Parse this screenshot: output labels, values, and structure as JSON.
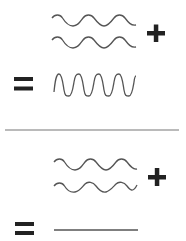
{
  "diagram": {
    "colors": {
      "wave": "#555555",
      "symbol": "#222222",
      "divider": "#777777",
      "background": "#ffffff"
    },
    "panels": [
      {
        "name": "constructive-interference",
        "inputs": [
          {
            "label": "wave-a",
            "cycles": 4,
            "amplitude": 5,
            "phase": "in-phase"
          },
          {
            "label": "wave-b",
            "cycles": 4,
            "amplitude": 5,
            "phase": "in-phase"
          }
        ],
        "operator": "+",
        "equals": "=",
        "result": {
          "label": "sum-wave",
          "cycles": 4,
          "amplitude": 11,
          "type": "amplified"
        }
      },
      {
        "name": "destructive-interference",
        "inputs": [
          {
            "label": "wave-a",
            "cycles": 4,
            "amplitude": 5,
            "phase": "0"
          },
          {
            "label": "wave-b",
            "cycles": 4,
            "amplitude": 5,
            "phase": "180"
          }
        ],
        "operator": "+",
        "equals": "=",
        "result": {
          "label": "flat-line",
          "cycles": 0,
          "amplitude": 0,
          "type": "cancelled"
        }
      }
    ]
  }
}
